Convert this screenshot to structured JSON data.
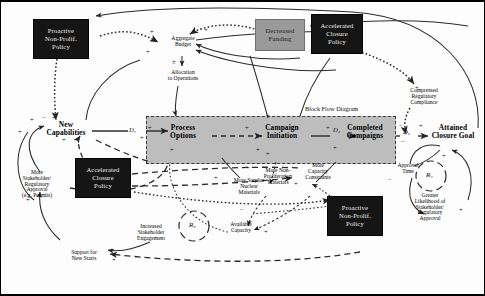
{
  "diagram": {
    "type": "causal-loop-diagram",
    "block_flow_label": "Block Flow Diagram",
    "policy_boxes": [
      {
        "id": "proactive-nonprolif-top",
        "label": "Proactive\nNon-Prolif.\nPolicy",
        "style": "dark"
      },
      {
        "id": "decreased-funding",
        "label": "Decreased\nFunding",
        "style": "gray"
      },
      {
        "id": "accelerated-closure-top",
        "label": "Accelerated\nClosure\nPolicy",
        "style": "dark"
      },
      {
        "id": "accelerated-closure-left",
        "label": "Accelerated\nClosure\nPolicy",
        "style": "dark"
      },
      {
        "id": "proactive-nonprolif-bottom",
        "label": "Proactive\nNon-Prolif.\nPolicy",
        "style": "dark"
      }
    ],
    "stock_variables": [
      {
        "id": "new-capabilities",
        "label": "New\nCapabilities"
      },
      {
        "id": "process-options",
        "label": "Process\nOptions"
      },
      {
        "id": "campaign-initiation",
        "label": "Campaign\nInitiation"
      },
      {
        "id": "completed-campaigns",
        "label": "Completed\nCampaigns"
      },
      {
        "id": "attained-closure-goal",
        "label": "Attained\nClosure Goal"
      }
    ],
    "aux_variables": [
      {
        "id": "aggregate-budget",
        "label": "Aggregate\nBudget"
      },
      {
        "id": "allocation-to-operations",
        "label": "Allocation\nto Operations"
      },
      {
        "id": "compressed-regulatory-compliance",
        "label": "Compressed\nRegulatory\nCompliance"
      },
      {
        "id": "more-stakeholder-regulatory-approval",
        "label": "More\nStakeholder/\nRegulatory\nApproval\n(e.g. Permits)"
      },
      {
        "id": "increased-stakeholder-engagement",
        "label": "Increased\nStakeholder\nEngagement"
      },
      {
        "id": "support-for-new-starts",
        "label": "Support for\nNew Starts"
      },
      {
        "id": "more-surplus-nuclear-materials",
        "label": "More Surplus\nNuclear\nMaterials"
      },
      {
        "id": "more-non-proliferation-materials",
        "label": "More Non-\nProliferation\nMaterials"
      },
      {
        "id": "more-capacity-constraints",
        "label": "More\nCapacity\nConstraints"
      },
      {
        "id": "available-capacity",
        "label": "Available\nCapacity"
      },
      {
        "id": "approval-time",
        "label": "Approval\nTime"
      },
      {
        "id": "greater-likelihood-approval",
        "label": "Greater\nLikelihood of\nStakeholder/\nRegulatory\nApproval"
      }
    ],
    "delay_labels": [
      {
        "id": "delay-1",
        "label": "D₁"
      },
      {
        "id": "delay-2",
        "label": "D₂"
      },
      {
        "id": "delay-3",
        "label": "D₃"
      }
    ],
    "loop_labels": [
      {
        "id": "loop-r3",
        "label": "R₃"
      },
      {
        "id": "loop-r4",
        "label": "R₄"
      }
    ],
    "polarity_marks": {
      "plus": "+",
      "minus": "−",
      "plus_minus": "±"
    },
    "colors": {
      "policy_dark": "#151515",
      "policy_gray": "#9a9a9a",
      "block_flow_fill": "#bdbdbd",
      "link": "#2b2b2b",
      "text": "#000000"
    }
  }
}
